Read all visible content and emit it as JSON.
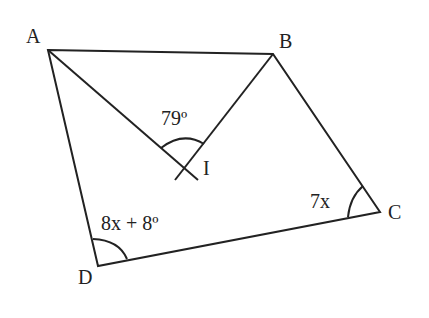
{
  "diagram": {
    "vertices": {
      "A": "A",
      "B": "B",
      "C": "C",
      "D": "D",
      "I": "I"
    },
    "angles": {
      "AIB": "79º",
      "C": "7x",
      "D": "8x + 8º"
    }
  }
}
